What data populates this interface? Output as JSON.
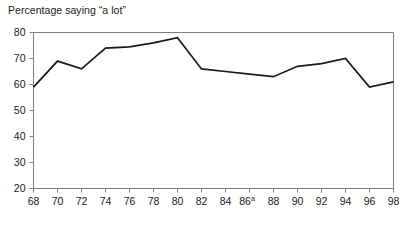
{
  "chart_data": {
    "type": "line",
    "title": "Percentage saying “a lot”",
    "xlabel": "",
    "ylabel": "",
    "x": [
      68,
      70,
      72,
      74,
      76,
      78,
      80,
      82,
      84,
      86,
      88,
      90,
      92,
      94,
      96,
      98
    ],
    "values": [
      59,
      69,
      66,
      74,
      74.5,
      76,
      78,
      66,
      65,
      64,
      63,
      67,
      68,
      70,
      59,
      61
    ],
    "series": [
      {
        "name": "Percentage saying “a lot”",
        "values": [
          59,
          69,
          66,
          74,
          74.5,
          76,
          78,
          66,
          65,
          64,
          63,
          67,
          68,
          70,
          59,
          61
        ]
      }
    ],
    "xlim": [
      68,
      98
    ],
    "ylim": [
      20,
      80
    ],
    "xticks": [
      "68",
      "70",
      "72",
      "74",
      "76",
      "78",
      "80",
      "82",
      "84",
      "86",
      "88",
      "90",
      "92",
      "94",
      "96",
      "98"
    ],
    "xtick_superscripts": [
      "",
      "",
      "",
      "",
      "",
      "",
      "",
      "",
      "",
      "a",
      "",
      "",
      "",
      "",
      "",
      ""
    ],
    "yticks": [
      "20",
      "30",
      "40",
      "50",
      "60",
      "70",
      "80"
    ],
    "grid": false,
    "legend": "none",
    "line_color": "#1a1a1a",
    "axis_color": "#808080",
    "background_color": "#ffffff"
  },
  "axis": {
    "title_text": "Percentage saying “a lot”"
  }
}
